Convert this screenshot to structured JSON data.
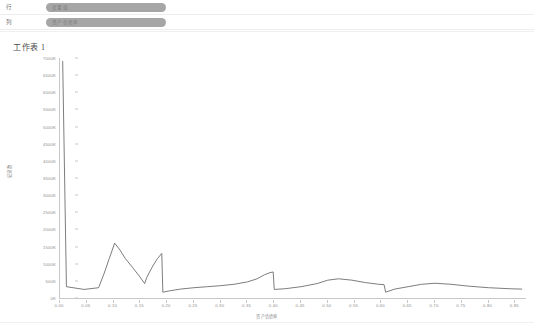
{
  "toolbar": {
    "rows_label": "行",
    "columns_label": "列",
    "rows_pill": "度量值",
    "columns_pill": "资产负债率"
  },
  "sheet": {
    "title": "工作表 1"
  },
  "chart_data": {
    "type": "line",
    "title": "工作表 1",
    "xlabel": "资产负债率",
    "ylabel": "记录数",
    "grid": false,
    "legend": "none",
    "line_color": "#6e6e6e",
    "xlim": [
      0.0,
      0.87
    ],
    "ylim": [
      0,
      7000
    ],
    "xticks": [
      "0.00",
      "0.05",
      "0.10",
      "0.15",
      "0.20",
      "0.25",
      "0.30",
      "0.35",
      "0.40",
      "0.45",
      "0.50",
      "0.55",
      "0.60",
      "0.65",
      "0.70",
      "0.75",
      "0.80",
      "0.85"
    ],
    "xtick_values": [
      0.0,
      0.05,
      0.1,
      0.15,
      0.2,
      0.25,
      0.3,
      0.35,
      0.4,
      0.45,
      0.5,
      0.55,
      0.6,
      0.65,
      0.7,
      0.75,
      0.8,
      0.85
    ],
    "yticks": [
      "7000K",
      "6500K",
      "6000K",
      "5500K",
      "5000K",
      "4500K",
      "4000K",
      "3500K",
      "3000K",
      "2500K",
      "2000K",
      "1500K",
      "1000K",
      "500K",
      "0K"
    ],
    "ytick_values": [
      7000,
      6500,
      6000,
      5500,
      5000,
      4500,
      4000,
      3500,
      3000,
      2500,
      2000,
      1500,
      1000,
      500,
      0
    ],
    "x": [
      0.005,
      0.012,
      0.045,
      0.072,
      0.082,
      0.092,
      0.102,
      0.112,
      0.122,
      0.135,
      0.148,
      0.158,
      0.162,
      0.172,
      0.182,
      0.19,
      0.192,
      0.205,
      0.225,
      0.25,
      0.275,
      0.3,
      0.325,
      0.35,
      0.368,
      0.382,
      0.392,
      0.398,
      0.4,
      0.42,
      0.45,
      0.48,
      0.5,
      0.52,
      0.545,
      0.57,
      0.595,
      0.605,
      0.608,
      0.625,
      0.65,
      0.675,
      0.7,
      0.73,
      0.76,
      0.8,
      0.84,
      0.862
    ],
    "y": [
      6900,
      330,
      250,
      300,
      700,
      1150,
      1600,
      1400,
      1150,
      900,
      640,
      420,
      600,
      900,
      1150,
      1300,
      170,
      210,
      260,
      300,
      330,
      360,
      400,
      470,
      560,
      680,
      740,
      760,
      250,
      270,
      330,
      420,
      520,
      560,
      520,
      450,
      400,
      390,
      170,
      260,
      330,
      400,
      430,
      400,
      350,
      300,
      270,
      260
    ]
  }
}
